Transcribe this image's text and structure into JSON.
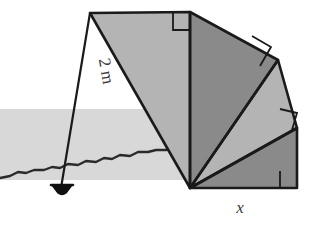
{
  "figure": {
    "colors": {
      "stroke": "#1a1a1a",
      "fill_light": "#b4b4b4",
      "fill_dark": "#8a8a8a",
      "fill_lighter": "#c6c6c6",
      "water_band": "#d8d8d8",
      "ground_line": "#2a2a2a",
      "label_color": "#3a3a3a",
      "background": "#ffffff"
    },
    "labels": {
      "hypotenuse_label": "2 m",
      "base_label": "x"
    },
    "geometry": {
      "apex": [
        190,
        188
      ],
      "top_left": [
        90,
        13
      ],
      "top_right": [
        190,
        12
      ],
      "outer_right_upper": [
        278,
        60
      ],
      "outer_right_mid": [
        297,
        128
      ],
      "bottom_right": [
        297,
        188
      ],
      "bob": [
        60,
        190
      ]
    },
    "triangles": [
      {
        "name": "triangle-1-left",
        "shade": "light",
        "points": "90,13 190,12 190,188"
      },
      {
        "name": "triangle-2-upper",
        "shade": "dark",
        "points": "190,12 278,60 190,188"
      },
      {
        "name": "triangle-3-right",
        "shade": "light",
        "points": "278,60 297,128 190,188"
      },
      {
        "name": "triangle-4-lower",
        "shade": "dark",
        "points": "297,128 297,188 190,188"
      }
    ],
    "right_angle_marks": [
      {
        "name": "right-angle-mark-top",
        "points": "173,12 173,30 191,30"
      },
      {
        "name": "right-angle-mark-upper-right",
        "points": "253,35 272,47 261,66"
      },
      {
        "name": "right-angle-mark-mid-right",
        "points": "281,108 297,114 291,130"
      },
      {
        "name": "right-angle-mark-bottom-right",
        "points": "281,172 297,172 297,188"
      }
    ],
    "plumb": {
      "line_from": [
        90,
        13
      ],
      "line_to": [
        60,
        190
      ],
      "bob_center": [
        62,
        186
      ]
    },
    "water": {
      "x": 0,
      "y": 109,
      "width": 185,
      "height": 71
    },
    "ground_path": "M 0,178 L 10,176 L 18,172 L 26,173 L 34,170 L 44,170 L 52,167 L 60,168 L 68,164 L 78,165 L 86,161 L 96,162 L 104,158 L 112,159 L 120,155 L 130,156 L 138,152 L 148,152 L 156,150 L 166,150 L 176,148 L 186,141 L 190,138"
  }
}
